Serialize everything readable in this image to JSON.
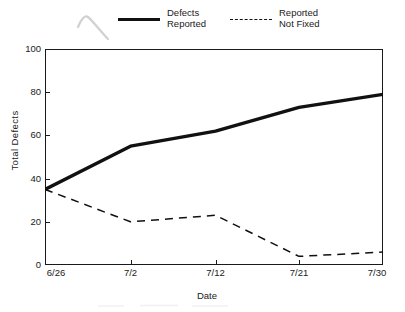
{
  "chart_data": {
    "type": "line",
    "title": "",
    "xlabel": "Date",
    "ylabel": "Total Defects",
    "x": [
      "6/26",
      "7/2",
      "7/12",
      "7/21",
      "7/30"
    ],
    "xtick_labels": [
      "6/26",
      "7/2",
      "7/12",
      "7/21",
      "7/30"
    ],
    "ytick_labels": [
      "0",
      "20",
      "40",
      "60",
      "80",
      "100"
    ],
    "ytick_values": [
      0,
      20,
      40,
      60,
      80,
      100
    ],
    "ylim": [
      0,
      100
    ],
    "grid": false,
    "legend_position": "above-plot",
    "series": [
      {
        "name": "Defects Reported",
        "name_line1": "Defects",
        "name_line2": "Reported",
        "style": "solid",
        "color": "#111111",
        "values": [
          35,
          55,
          62,
          73,
          79
        ]
      },
      {
        "name": "Reported Not Fixed",
        "name_line1": "Reported",
        "name_line2": "Not Fixed",
        "style": "dashed",
        "color": "#111111",
        "values": [
          35,
          20,
          23,
          4,
          6
        ]
      }
    ]
  },
  "axes": {
    "ylabel": "Total Defects",
    "xlabel": "Date",
    "yticks": [
      "100",
      "80",
      "60",
      "40",
      "20",
      "0"
    ],
    "xticks": [
      "6/26",
      "7/2",
      "7/12",
      "7/21",
      "7/30"
    ]
  },
  "legend": {
    "entries": [
      {
        "line1": "Defects",
        "line2": "Reported",
        "style": "solid"
      },
      {
        "line1": "Reported",
        "line2": "Not Fixed",
        "style": "dashed"
      }
    ]
  }
}
